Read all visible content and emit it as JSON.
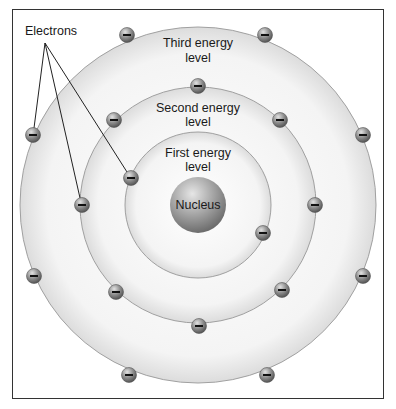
{
  "diagram": {
    "labels": {
      "electrons": "Electrons",
      "third_level": [
        "Third energy",
        "level"
      ],
      "second_level": [
        "Second energy",
        "level"
      ],
      "first_level": [
        "First energy",
        "level"
      ],
      "nucleus": "Nucleus"
    },
    "center": [
      198,
      205
    ],
    "rings": [
      {
        "name": "first-energy-level",
        "radius": 73
      },
      {
        "name": "second-energy-level",
        "radius": 118
      },
      {
        "name": "third-energy-level",
        "radius": 178
      }
    ],
    "electrons": [
      {
        "ring": "third",
        "x": 127,
        "y": 35
      },
      {
        "ring": "third",
        "x": 265,
        "y": 35
      },
      {
        "ring": "third",
        "x": 33,
        "y": 135
      },
      {
        "ring": "third",
        "x": 363,
        "y": 135
      },
      {
        "ring": "third",
        "x": 34,
        "y": 276
      },
      {
        "ring": "third",
        "x": 363,
        "y": 276
      },
      {
        "ring": "third",
        "x": 129,
        "y": 375
      },
      {
        "ring": "third",
        "x": 267,
        "y": 375
      },
      {
        "ring": "second",
        "x": 198,
        "y": 86
      },
      {
        "ring": "second",
        "x": 114,
        "y": 120
      },
      {
        "ring": "second",
        "x": 280,
        "y": 120
      },
      {
        "ring": "second",
        "x": 82,
        "y": 205
      },
      {
        "ring": "second",
        "x": 315,
        "y": 205
      },
      {
        "ring": "second",
        "x": 116,
        "y": 292
      },
      {
        "ring": "second",
        "x": 282,
        "y": 290
      },
      {
        "ring": "second",
        "x": 199,
        "y": 326
      },
      {
        "ring": "first",
        "x": 131,
        "y": 178
      },
      {
        "ring": "first",
        "x": 263,
        "y": 233
      }
    ],
    "pointer_lines_from": [
      45,
      43
    ],
    "pointer_targets": [
      [
        33,
        135
      ],
      [
        82,
        205
      ],
      [
        131,
        178
      ]
    ],
    "colors": {
      "ring_fill": "#f1f1f1",
      "ring_edge": "#9a9a9a",
      "electron": "#8a8a8a",
      "nucleus": "#9b9b9b",
      "frame": "#333333"
    }
  }
}
